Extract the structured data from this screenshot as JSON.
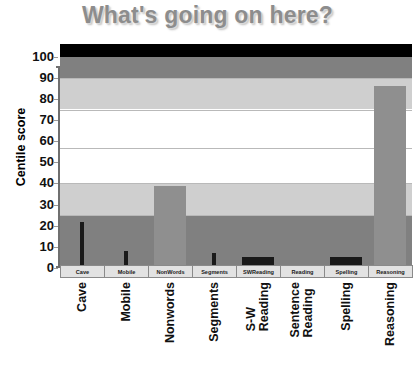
{
  "chart": {
    "title": "What's going on here?",
    "ylabel": "Centile score"
  },
  "chart_data": {
    "type": "bar",
    "title": "What's going on here?",
    "xlabel": "",
    "ylabel": "Centile score",
    "ylim": [
      0,
      100
    ],
    "yticks": [
      0,
      10,
      20,
      30,
      40,
      50,
      60,
      70,
      80,
      90,
      100
    ],
    "grid": true,
    "legend": "none",
    "categories": [
      "Cave",
      "Mobile",
      "Nonwords",
      "Segments",
      "S-W Reading",
      "Sentence Reading",
      "Spelling",
      "Reasoning"
    ],
    "values": [
      22,
      8,
      39,
      7,
      5,
      0,
      5,
      86
    ],
    "bar_styles": [
      {
        "category": "Cave",
        "color": "#1a1a1a",
        "width": "narrow"
      },
      {
        "category": "Mobile",
        "color": "#1a1a1a",
        "width": "narrow"
      },
      {
        "category": "Nonwords",
        "color": "#8f8f8f",
        "width": "wide"
      },
      {
        "category": "Segments",
        "color": "#1a1a1a",
        "width": "narrow"
      },
      {
        "category": "S-W Reading",
        "color": "#1a1a1a",
        "width": "wide"
      },
      {
        "category": "Sentence Reading",
        "color": "#1a1a1a",
        "width": "wide"
      },
      {
        "category": "Spelling",
        "color": "#1a1a1a",
        "width": "wide"
      },
      {
        "category": "Reasoning",
        "color": "#8f8f8f",
        "width": "wide"
      }
    ],
    "background_bands": [
      {
        "from": 100,
        "to": 106,
        "color": "#000000",
        "label": "top-black-strip"
      },
      {
        "from": 90,
        "to": 100,
        "color": "#808080",
        "label": "dark-gray-upper"
      },
      {
        "from": 75,
        "to": 90,
        "color": "#cfcfcf",
        "label": "light-gray-upper"
      },
      {
        "from": 40,
        "to": 75,
        "color": "#ffffff",
        "label": "white-middle"
      },
      {
        "from": 25,
        "to": 40,
        "color": "#cfcfcf",
        "label": "light-gray-lower"
      },
      {
        "from": 0,
        "to": 25,
        "color": "#808080",
        "label": "dark-gray-lower"
      }
    ],
    "gridlines": [
      25,
      40,
      57,
      75,
      90
    ]
  },
  "axis": {
    "tick_labels": [
      "100",
      "90",
      "80",
      "70",
      "60",
      "50",
      "40",
      "30",
      "20",
      "10",
      "0"
    ]
  },
  "category_strip": {
    "cells": [
      "Cave",
      "Mobile",
      "NonWords",
      "Segments",
      "SWReading",
      "Reading",
      "Spelling",
      "Reasoning"
    ]
  },
  "x_axis_labels": [
    {
      "lines": [
        "Cave"
      ]
    },
    {
      "lines": [
        "Mobile"
      ]
    },
    {
      "lines": [
        "Nonwords"
      ]
    },
    {
      "lines": [
        "Segments"
      ]
    },
    {
      "lines": [
        "S-W",
        "Reading"
      ]
    },
    {
      "lines": [
        "Sentence",
        "Reading"
      ]
    },
    {
      "lines": [
        "Spelling"
      ]
    },
    {
      "lines": [
        "Reasoning"
      ]
    }
  ],
  "colors": {
    "title": "#8d8d8d",
    "bar_dark": "#1a1a1a",
    "bar_gray": "#8f8f8f",
    "band_dark": "#808080",
    "band_light": "#cfcfcf",
    "band_white": "#ffffff",
    "axis": "#6f6f6f"
  }
}
